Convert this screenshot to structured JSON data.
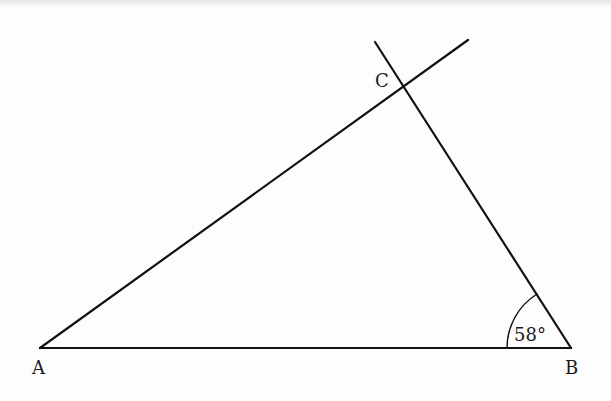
{
  "diagram": {
    "type": "triangle",
    "vertices": {
      "A": {
        "label": "A",
        "x": 40,
        "y": 348
      },
      "B": {
        "label": "B",
        "x": 571,
        "y": 348
      },
      "C": {
        "label": "C",
        "x": 404,
        "y": 86
      }
    },
    "angle_B": {
      "label": "58°",
      "value": 58,
      "unit": "degrees"
    },
    "extended_lines": [
      "AC extended beyond C",
      "BC extended beyond C"
    ],
    "line_color": "#111111"
  }
}
